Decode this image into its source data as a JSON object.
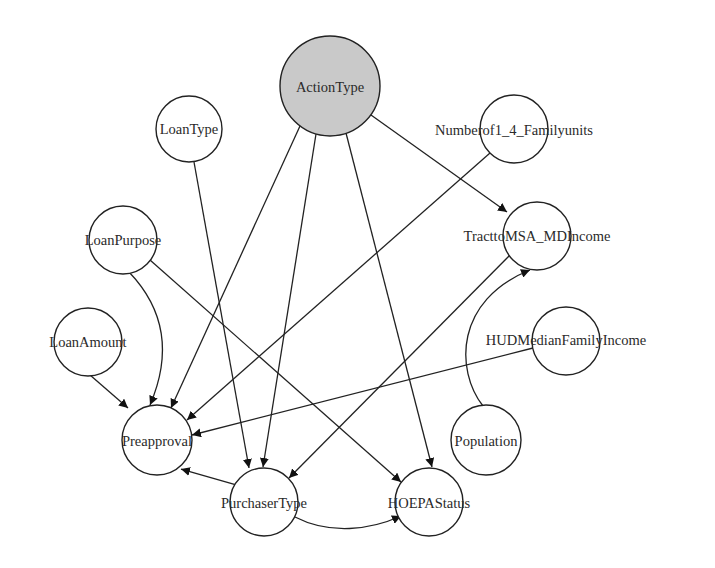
{
  "diagram": {
    "type": "bayesian-network",
    "nodes": [
      {
        "id": "ActionType",
        "label": "ActionType",
        "x": 330,
        "y": 86,
        "r": 50,
        "highlighted": true
      },
      {
        "id": "LoanType",
        "label": "LoanType",
        "x": 189,
        "y": 129,
        "r": 33,
        "highlighted": false
      },
      {
        "id": "Numberof1_4_Familyunits",
        "label": "Numberof1_4_Familyunits",
        "x": 514,
        "y": 129,
        "r": 34,
        "highlighted": false
      },
      {
        "id": "LoanPurpose",
        "label": "LoanPurpose",
        "x": 123,
        "y": 240,
        "r": 34,
        "highlighted": false
      },
      {
        "id": "TracttoMSA_MDIncome",
        "label": "TracttoMSA_MDIncome",
        "x": 537,
        "y": 236,
        "r": 34,
        "highlighted": false
      },
      {
        "id": "LoanAmount",
        "label": "LoanAmount",
        "x": 88,
        "y": 342,
        "r": 34,
        "highlighted": false
      },
      {
        "id": "HUDMedianFamilyIncome",
        "label": "HUDMedianFamilyIncome",
        "x": 566,
        "y": 341,
        "r": 34,
        "highlighted": false
      },
      {
        "id": "Preapproval",
        "label": "Preapproval",
        "x": 157,
        "y": 440,
        "r": 35,
        "highlighted": false
      },
      {
        "id": "Population",
        "label": "Population",
        "x": 486,
        "y": 440,
        "r": 35,
        "highlighted": false
      },
      {
        "id": "PurchaserType",
        "label": "PurchaserType",
        "x": 264,
        "y": 502,
        "r": 34,
        "highlighted": false
      },
      {
        "id": "HOEPAStatus",
        "label": "HOEPAStatus",
        "x": 429,
        "y": 502,
        "r": 34,
        "highlighted": false
      }
    ],
    "edges": [
      {
        "from": "ActionType",
        "to": "Preapproval"
      },
      {
        "from": "ActionType",
        "to": "PurchaserType"
      },
      {
        "from": "ActionType",
        "to": "HOEPAStatus"
      },
      {
        "from": "ActionType",
        "to": "TracttoMSA_MDIncome"
      },
      {
        "from": "LoanType",
        "to": "PurchaserType"
      },
      {
        "from": "Numberof1_4_Familyunits",
        "to": "Preapproval"
      },
      {
        "from": "LoanPurpose",
        "to": "Preapproval",
        "curved": true
      },
      {
        "from": "LoanPurpose",
        "to": "HOEPAStatus"
      },
      {
        "from": "LoanAmount",
        "to": "Preapproval"
      },
      {
        "from": "TracttoMSA_MDIncome",
        "to": "PurchaserType"
      },
      {
        "from": "HUDMedianFamilyIncome",
        "to": "Preapproval"
      },
      {
        "from": "Population",
        "to": "TracttoMSA_MDIncome",
        "curved": true
      },
      {
        "from": "PurchaserType",
        "to": "Preapproval"
      },
      {
        "from": "PurchaserType",
        "to": "HOEPAStatus",
        "curved": true
      }
    ],
    "colors": {
      "background": "#ffffff",
      "stroke": "#222222",
      "highlight_fill": "#c9c9c9",
      "node_fill": "#ffffff"
    }
  }
}
